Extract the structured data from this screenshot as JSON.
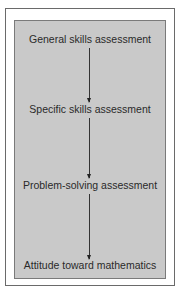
{
  "diagram": {
    "type": "flowchart",
    "direction": "top-to-bottom",
    "steps": [
      {
        "label": "General skills assessment"
      },
      {
        "label": "Specific skills assessment"
      },
      {
        "label": "Problem-solving assessment"
      },
      {
        "label": "Attitude toward mathematics"
      }
    ],
    "colors": {
      "panel_bg": "#c9c9c9",
      "frame_bg": "#ffffff",
      "text": "#2a2a2a",
      "arrow": "#333333"
    }
  }
}
